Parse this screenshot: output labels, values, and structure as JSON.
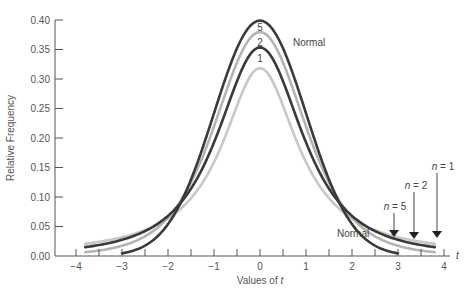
{
  "chart_data": {
    "type": "line",
    "title": "",
    "xlabel": "Values of t",
    "ylabel": "Relative Frequency",
    "xlim": [
      -4,
      4
    ],
    "ylim": [
      0.0,
      0.4
    ],
    "x_ticks": [
      -4,
      -3,
      -2,
      -1,
      0,
      1,
      2,
      3,
      4
    ],
    "x_tick_labels": [
      "−4",
      "−3",
      "−2",
      "−1",
      "0",
      "1",
      "2",
      "3",
      "4"
    ],
    "y_ticks": [
      0.0,
      0.05,
      0.1,
      0.15,
      0.2,
      0.25,
      0.3,
      0.35,
      0.4
    ],
    "y_tick_labels": [
      "0.00",
      "0.05",
      "0.10",
      "0.15",
      "0.20",
      "0.25",
      "0.30",
      "0.35",
      "0.40"
    ],
    "x_axis_end_label": "t",
    "grid": false,
    "series": [
      {
        "name": "Normal",
        "df": null,
        "color": "#3a3a3a",
        "x_range": [
          -3,
          3
        ],
        "peak": 0.399,
        "x": [
          -3,
          -2,
          -1,
          0,
          1,
          2,
          3
        ],
        "values": [
          0.004,
          0.054,
          0.242,
          0.399,
          0.242,
          0.054,
          0.004
        ]
      },
      {
        "name": "n = 5",
        "df": 5,
        "color": "#b4b4b4",
        "x_range": [
          -3.8,
          3.8
        ],
        "peak": 0.38,
        "x": [
          -3,
          -2,
          -1,
          0,
          1,
          2,
          3
        ],
        "values": [
          0.018,
          0.065,
          0.22,
          0.38,
          0.22,
          0.065,
          0.018
        ]
      },
      {
        "name": "n = 2",
        "df": 2,
        "color": "#3a3a3a",
        "x_range": [
          -3.8,
          3.8
        ],
        "peak": 0.354,
        "x": [
          -3,
          -2,
          -1,
          0,
          1,
          2,
          3
        ],
        "values": [
          0.027,
          0.068,
          0.192,
          0.354,
          0.192,
          0.068,
          0.027
        ]
      },
      {
        "name": "n = 1",
        "df": 1,
        "color": "#c8c8c8",
        "x_range": [
          -3.8,
          3.8
        ],
        "peak": 0.318,
        "x": [
          -3,
          -2,
          -1,
          0,
          1,
          2,
          3
        ],
        "values": [
          0.032,
          0.064,
          0.159,
          0.318,
          0.159,
          0.064,
          0.032
        ]
      }
    ],
    "annotations": {
      "peak_labels": [
        "5",
        "2",
        "1"
      ],
      "normal_top_label": "Normal",
      "normal_tail_label": "Normal",
      "arrow_labels": [
        {
          "text_prefix": "n",
          "text_suffix": " = 5",
          "x": 2.9
        },
        {
          "text_prefix": "n",
          "text_suffix": " = 2",
          "x": 3.35
        },
        {
          "text_prefix": "n",
          "text_suffix": " = 1",
          "x": 3.85
        }
      ]
    }
  }
}
